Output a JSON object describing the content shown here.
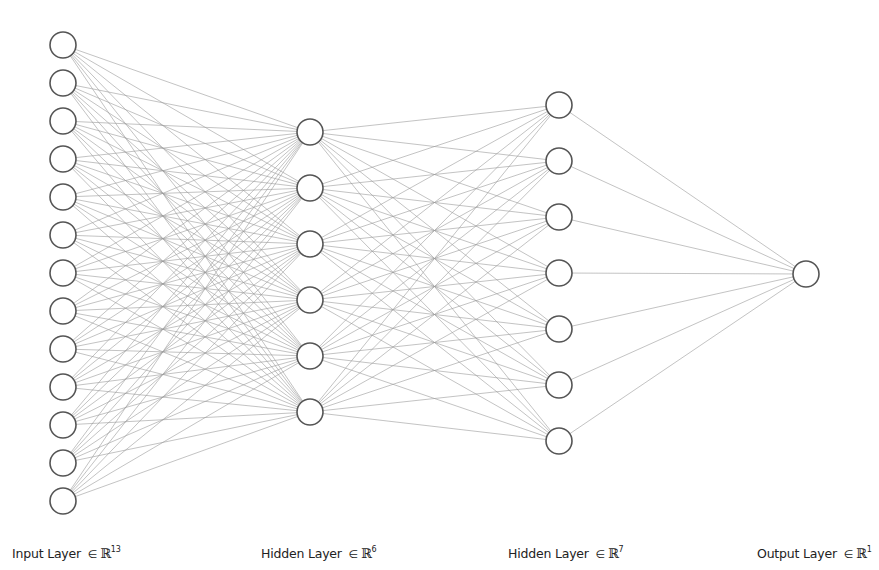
{
  "diagram": {
    "colors": {
      "background": "#ffffff",
      "node_stroke": "#555555",
      "node_fill": "#ffffff",
      "edge": "#9a9a9a",
      "label_text": "#222222"
    },
    "node_radius": 13,
    "layers": [
      {
        "id": "input",
        "name": "Input Layer",
        "symbol": "∈",
        "set": "ℝ",
        "dimension": "13",
        "size": 13,
        "x": 63,
        "y_first": 45,
        "y_step": 38,
        "label_x": 12
      },
      {
        "id": "hidden1",
        "name": "Hidden Layer",
        "symbol": "∈",
        "set": "ℝ",
        "dimension": "6",
        "size": 6,
        "x": 310,
        "y_first": 132,
        "y_step": 56,
        "label_x": 261
      },
      {
        "id": "hidden2",
        "name": "Hidden Layer",
        "symbol": "∈",
        "set": "ℝ",
        "dimension": "7",
        "size": 7,
        "x": 559,
        "y_first": 105,
        "y_step": 56,
        "label_x": 508
      },
      {
        "id": "output",
        "name": "Output Layer",
        "symbol": "∈",
        "set": "ℝ",
        "dimension": "1",
        "size": 1,
        "x": 806,
        "y_first": 274,
        "y_step": 0,
        "label_x": 757
      }
    ],
    "connectivity": "fully-connected"
  }
}
